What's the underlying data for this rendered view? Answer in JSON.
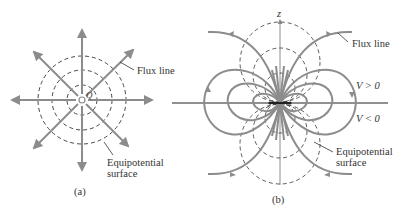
{
  "figure": {
    "panel_a": {
      "caption": "(a)",
      "charge_label": "Q",
      "flux_label": "Flux line",
      "equipotential_label_line1": "Equipotential",
      "equipotential_label_line2": "surface",
      "center": [
        82,
        100
      ],
      "circle_radii": [
        15,
        30,
        44
      ],
      "ray_length": 70
    },
    "panel_b": {
      "caption": "(b)",
      "axis_label": "z",
      "flux_label": "Flux line",
      "v_positive_label": "V > 0",
      "v_negative_label": "V < 0",
      "equipotential_label_line1": "Equipotential",
      "equipotential_label_line2": "surface",
      "center": [
        280,
        103
      ]
    },
    "colors": {
      "flux": "#8c8c8c",
      "equipotential": "#333333",
      "axis": "#222222",
      "text": "#333333"
    }
  }
}
